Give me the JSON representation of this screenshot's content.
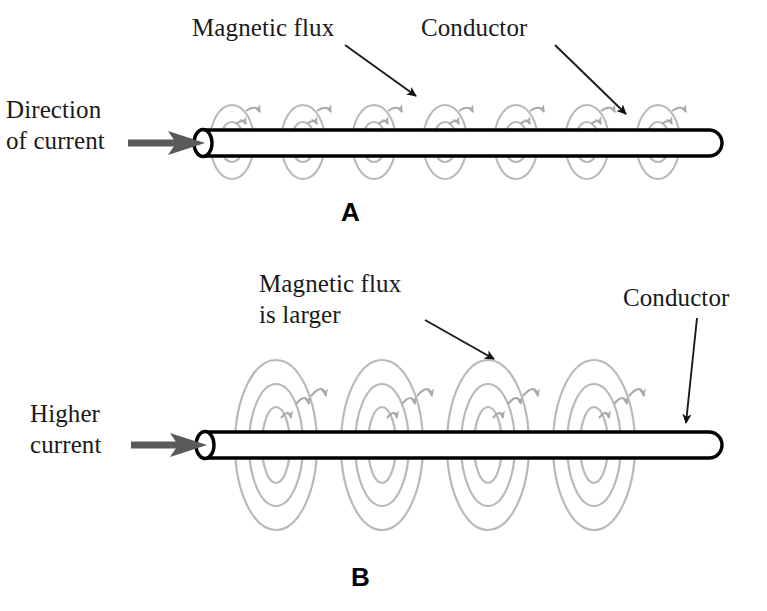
{
  "figure": {
    "background_color": "#ffffff",
    "width": 767,
    "height": 611
  },
  "colors": {
    "flux_line": "#b9b9b9",
    "flux_arrow": "#a9a9a9",
    "conductor_outline": "#000000",
    "conductor_fill": "#ffffff",
    "current_arrow": "#5a5a5a",
    "leader_line": "#1a1a1a",
    "text": "#1a1a1a"
  },
  "panel_a": {
    "letter": "A",
    "labels": {
      "magnetic_flux": "Magnetic flux",
      "conductor": "Conductor",
      "current": "Direction\nof current",
      "current_line1": "Direction",
      "current_line2": "of current"
    },
    "flux": {
      "loop_count": 6,
      "rings_per_loop": 2,
      "loop_centers_x": [
        232,
        303,
        374,
        445,
        516,
        587
      ],
      "center_y": 142,
      "ring_radii_x": [
        12,
        22
      ],
      "ring_radii_y": [
        20,
        37
      ]
    },
    "conductor": {
      "x_start": 190,
      "x_end": 722,
      "y_top": 130,
      "y_bottom": 156
    }
  },
  "panel_b": {
    "letter": "B",
    "labels": {
      "magnetic_flux": "Magnetic flux\nis larger",
      "magnetic_flux_line1": "Magnetic flux",
      "magnetic_flux_line2": "is larger",
      "conductor": "Conductor",
      "current": "Higher\ncurrent",
      "current_line1": "Higher",
      "current_line2": "current"
    },
    "flux": {
      "loop_count": 4,
      "rings_per_loop": 3,
      "loop_centers_x": [
        276,
        382,
        488,
        594
      ],
      "center_y": 445,
      "ring_radii_x": [
        14,
        27,
        41
      ],
      "ring_radii_y": [
        38,
        61,
        85
      ]
    },
    "conductor": {
      "x_start": 192,
      "x_end": 722,
      "y_top": 432,
      "y_bottom": 458
    }
  },
  "annotations": [
    {
      "name": "magnetic-flux-leader-a",
      "from_x": 345,
      "from_y": 45,
      "to_x": 419,
      "to_y": 98
    },
    {
      "name": "conductor-leader-a",
      "from_x": 555,
      "from_y": 45,
      "to_x": 630,
      "to_y": 118
    },
    {
      "name": "magnetic-flux-leader-b",
      "from_x": 425,
      "from_y": 320,
      "to_x": 497,
      "to_y": 362
    },
    {
      "name": "conductor-leader-b",
      "from_x": 697,
      "from_y": 318,
      "to_x": 685,
      "to_y": 428
    }
  ]
}
